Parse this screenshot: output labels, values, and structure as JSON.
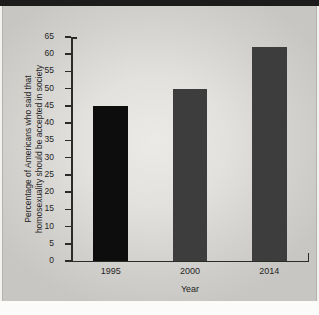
{
  "figure": {
    "background_color": "#e3e1dd",
    "top_rule_color": "#1c1c1c"
  },
  "chart_data": {
    "type": "bar",
    "title": "",
    "xlabel": "Year",
    "ylabel": "Percentage of Americans who said that homosexuality should be accepted in society",
    "ylabel_line1": "Percentage of Americans who said that",
    "ylabel_line2": "homosexuality should be accepted in society",
    "categories": [
      "1995",
      "2000",
      "2014"
    ],
    "values": [
      45,
      50,
      62
    ],
    "bar_colors": [
      "#0d0d0d",
      "#3d3d3d",
      "#3d3d3d"
    ],
    "ylim": [
      0,
      65
    ],
    "ytick_step": 5,
    "yticks": [
      0,
      5,
      10,
      15,
      20,
      25,
      30,
      35,
      40,
      45,
      50,
      55,
      60,
      65
    ],
    "ytick_labels": [
      "0",
      "5",
      "10",
      "15",
      "20",
      "25",
      "30",
      "35",
      "40",
      "45",
      "50",
      "55",
      "60",
      "65"
    ],
    "grid": false,
    "legend": false,
    "axis_color": "#2b2b2b"
  }
}
